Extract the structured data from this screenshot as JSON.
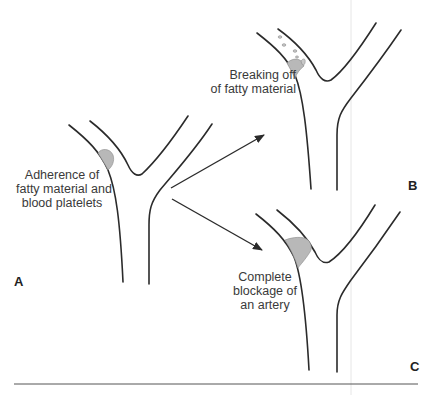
{
  "figure": {
    "panels": [
      {
        "id": "A",
        "letter": "A",
        "caption_lines": [
          "Adherence of",
          "fatty material and",
          "blood platelets"
        ]
      },
      {
        "id": "B",
        "letter": "B",
        "caption_lines": [
          "Breaking off",
          "of fatty material"
        ]
      },
      {
        "id": "C",
        "letter": "C",
        "caption_lines": [
          "Complete",
          "blockage of",
          "an artery"
        ]
      }
    ],
    "arrows": [
      {
        "from": "A",
        "to": "B"
      },
      {
        "from": "A",
        "to": "C"
      }
    ],
    "colors": {
      "vessel_stroke": "#2b2b2b",
      "plaque_fill": "#b8b8b8",
      "rule": "#555555",
      "text": "#3a3a3a"
    }
  }
}
